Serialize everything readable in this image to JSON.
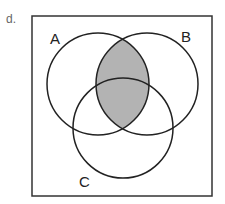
{
  "problem": {
    "label": "d."
  },
  "diagram": {
    "type": "venn-3",
    "sets": [
      {
        "name": "A",
        "cx": 98,
        "cy": 84,
        "r": 51
      },
      {
        "name": "B",
        "cx": 147,
        "cy": 84,
        "r": 51
      },
      {
        "name": "C",
        "cx": 123,
        "cy": 128,
        "r": 50
      }
    ],
    "shaded_region": "A ∩ B",
    "shade_color": "#b3b3b3",
    "stroke_color": "#222222"
  }
}
